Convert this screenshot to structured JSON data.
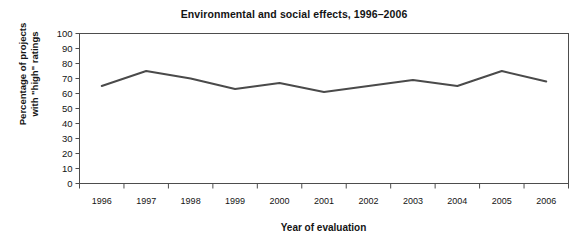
{
  "chart_data": {
    "type": "line",
    "title": "Environmental and social effects, 1996–2006",
    "xlabel": "Year of evaluation",
    "ylabel": "Percentage of projects\nwith \"high\" ratings",
    "categories": [
      "1996",
      "1997",
      "1998",
      "1999",
      "2000",
      "2001",
      "2002",
      "2003",
      "2004",
      "2005",
      "2006"
    ],
    "x": [
      1996,
      1997,
      1998,
      1999,
      2000,
      2001,
      2002,
      2003,
      2004,
      2005,
      2006
    ],
    "series": [
      {
        "name": "Percentage of projects with \"high\" ratings",
        "values": [
          65,
          75,
          70,
          63,
          67,
          61,
          65,
          69,
          65,
          75,
          68
        ],
        "color": "#4a4a4a"
      }
    ],
    "ylim": [
      0,
      100
    ],
    "yticks": [
      0,
      10,
      20,
      30,
      40,
      50,
      60,
      70,
      80,
      90,
      100
    ],
    "ytick_labels": [
      "0",
      "10",
      "20",
      "30",
      "40",
      "50",
      "60",
      "70",
      "80",
      "90",
      "100"
    ],
    "grid": false,
    "legend": "none",
    "frame": "box",
    "annotations": []
  }
}
